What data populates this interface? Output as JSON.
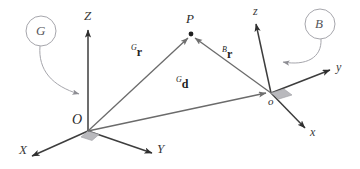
{
  "figure": {
    "caption_absent": true,
    "frames": [
      {
        "key": "global",
        "label": "G",
        "origin_label": "O",
        "axes": [
          {
            "name": "X",
            "label": "X"
          },
          {
            "name": "Y",
            "label": "Y"
          },
          {
            "name": "Z",
            "label": "Z"
          }
        ]
      },
      {
        "key": "body",
        "label": "B",
        "origin_label": "o",
        "axes": [
          {
            "name": "x",
            "label": "x"
          },
          {
            "name": "y",
            "label": "y"
          },
          {
            "name": "z",
            "label": "z"
          }
        ]
      }
    ],
    "points": [
      {
        "key": "P",
        "label": "P"
      }
    ],
    "vectors": [
      {
        "key": "Gr",
        "superscript": "G",
        "symbol": "r",
        "from": "O",
        "to": "P"
      },
      {
        "key": "Br",
        "superscript": "B",
        "symbol": "r",
        "from": "o",
        "to": "P"
      },
      {
        "key": "Gd",
        "superscript": "G",
        "symbol": "d",
        "from": "O",
        "to": "o"
      }
    ],
    "colors": {
      "line": "#4a4a4a",
      "axis": "#3d3d3d",
      "vector": "#6b6b6b",
      "leader": "#9a9aa0",
      "right_angle_fill": "#b9b9bd",
      "text": "#2b2b2b"
    }
  }
}
